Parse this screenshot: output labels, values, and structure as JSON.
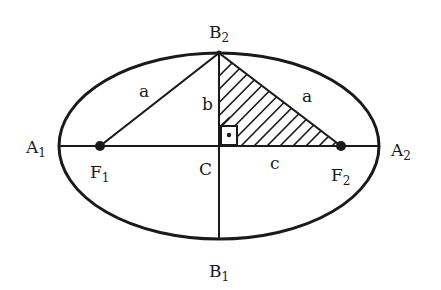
{
  "diagram": {
    "type": "ellipse-geometry",
    "colors": {
      "stroke": "#1a1a1a",
      "background": "#ffffff"
    },
    "vertices": {
      "A1": {
        "letter": "A",
        "sub": "1"
      },
      "A2": {
        "letter": "A",
        "sub": "2"
      },
      "B1": {
        "letter": "B",
        "sub": "1"
      },
      "B2": {
        "letter": "B",
        "sub": "2"
      },
      "F1": {
        "letter": "F",
        "sub": "1"
      },
      "F2": {
        "letter": "F",
        "sub": "2"
      },
      "C": {
        "letter": "C"
      }
    },
    "segments": {
      "a_left": "a",
      "a_right": "a",
      "b": "b",
      "c": "c"
    },
    "right_angle_mark": "•"
  }
}
